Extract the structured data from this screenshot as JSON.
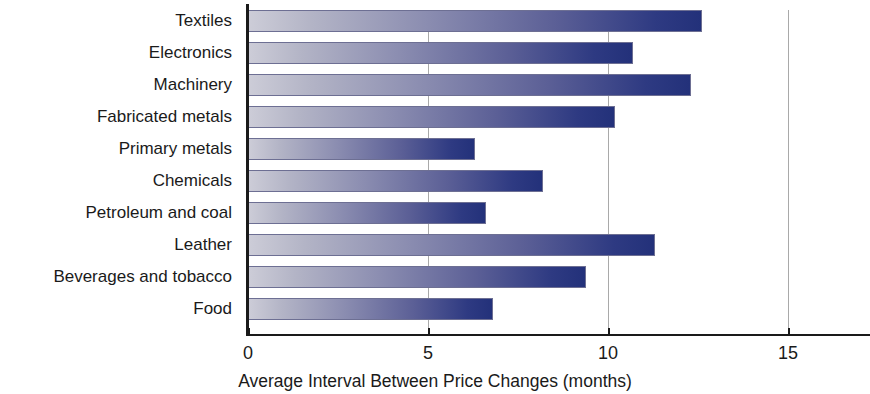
{
  "chart_data": {
    "type": "bar",
    "orientation": "horizontal",
    "title": "",
    "xlabel": "Average Interval Between Price Changes (months)",
    "ylabel": "",
    "categories": [
      "Textiles",
      "Electronics",
      "Machinery",
      "Fabricated metals",
      "Primary metals",
      "Chemicals",
      "Petroleum and coal",
      "Leather",
      "Beverages and tobacco",
      "Food"
    ],
    "values": [
      12.6,
      10.7,
      12.3,
      10.2,
      6.3,
      8.2,
      6.6,
      11.3,
      9.4,
      6.8
    ],
    "xlim": [
      0,
      17.3
    ],
    "xticks": [
      0,
      5,
      10,
      15
    ],
    "xtick_labels": [
      "0",
      "5",
      "10",
      "15"
    ],
    "grid": "vertical-at-ticks",
    "legend": null,
    "bar_fill": "gradient-light-gray-to-navy",
    "bar_color_start": "#cdcdd8",
    "bar_color_end": "#23317a",
    "axis_color": "#1a1a1a",
    "gridline_color": "#a9a9a9",
    "background": "#ffffff"
  },
  "axis": {
    "x_title": "Average Interval Between Price Changes (months)"
  },
  "artifacts": {
    "watermark": ""
  }
}
